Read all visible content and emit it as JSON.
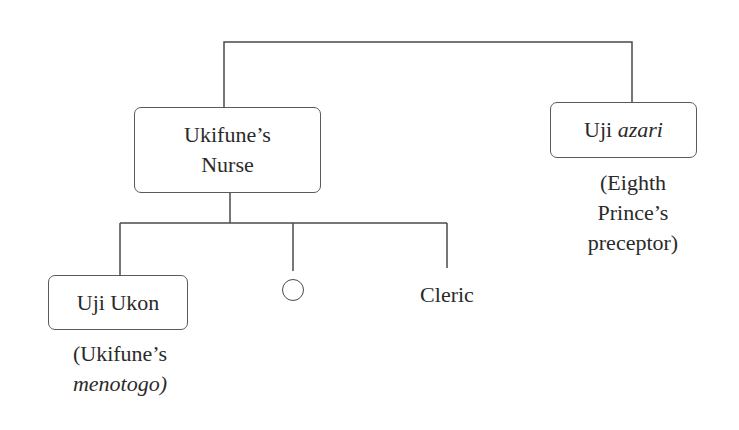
{
  "diagram": {
    "type": "genealogy-tree",
    "line_color": "#4a4a4a",
    "nodes": {
      "nurse": {
        "line1": "Ukifune’s",
        "line2": "Nurse"
      },
      "azari": {
        "name_plain": "Uji ",
        "name_italic": "azari",
        "note_line1": "(Eighth",
        "note_line2": "Prince’s",
        "note_line3": "preceptor)"
      },
      "ukon": {
        "name": "Uji Ukon",
        "note_line1": "(Ukifune’s",
        "note_line2": "menotogo)"
      },
      "unnamed": {
        "symbol": "circle"
      },
      "cleric": {
        "name": "Cleric"
      }
    },
    "edges": [
      {
        "from": "parent-bar",
        "to": "nurse"
      },
      {
        "from": "parent-bar",
        "to": "azari"
      },
      {
        "from": "nurse",
        "to": "ukon"
      },
      {
        "from": "nurse",
        "to": "unnamed"
      },
      {
        "from": "nurse",
        "to": "cleric"
      }
    ]
  }
}
